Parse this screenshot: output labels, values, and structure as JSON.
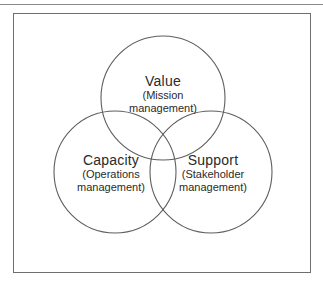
{
  "diagram": {
    "type": "venn",
    "stroke_color": "#5e5e5e",
    "text_color": "#2a2a2a",
    "circles": [
      {
        "id": "value",
        "title": "Value",
        "subtitle_line1": "(Mission",
        "subtitle_line2": "management)",
        "cx": 163,
        "cy": 98,
        "r": 62
      },
      {
        "id": "capacity",
        "title": "Capacity",
        "subtitle_line1": "(Operations",
        "subtitle_line2": "management)",
        "cx": 115,
        "cy": 172,
        "r": 61
      },
      {
        "id": "support",
        "title": "Support",
        "subtitle_line1": "(Stakeholder",
        "subtitle_line2": "management)",
        "cx": 211,
        "cy": 172,
        "r": 61
      }
    ]
  }
}
